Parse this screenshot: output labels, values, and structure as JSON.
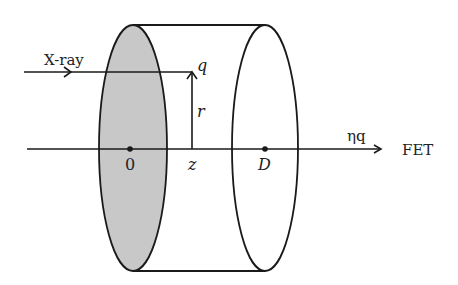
{
  "diagram": {
    "labels": {
      "xray": "X-ray",
      "q": "q",
      "r": "r",
      "origin": "0",
      "z": "z",
      "D": "D",
      "eta_q": "ηq",
      "fet": "FET"
    },
    "colors": {
      "stroke": "#1a1a1a",
      "shaded_face": "#c8c8c8",
      "background": "#ffffff"
    }
  }
}
